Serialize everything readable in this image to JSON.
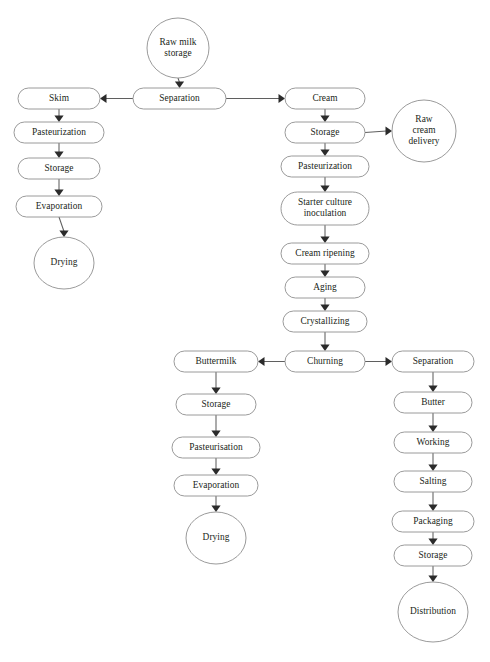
{
  "diagram": {
    "style": {
      "background": "#ffffff",
      "node_fill": "#ffffff",
      "node_stroke": "#8e8e8e",
      "edge_stroke": "#5f5f5f",
      "arrow_fill": "#2b2b2b",
      "label_color": "#221f20"
    },
    "nodes": [
      {
        "id": "raw_milk_storage",
        "label": "Raw milk\nstorage",
        "lines": [
          "Raw milk",
          "storage"
        ],
        "shape": "ellipse",
        "cx": 178,
        "cy": 48,
        "rx": 31,
        "ry": 30
      },
      {
        "id": "separation_top",
        "label": "Separation",
        "lines": [
          "Separation"
        ],
        "shape": "rounded-rect",
        "x": 133,
        "y": 88,
        "w": 93,
        "h": 21
      },
      {
        "id": "skim",
        "label": "Skim",
        "lines": [
          "Skim"
        ],
        "shape": "rounded-rect",
        "x": 18,
        "y": 88,
        "w": 82,
        "h": 21
      },
      {
        "id": "skim_pasteurization",
        "label": "Pasteurization",
        "lines": [
          "Pasteurization"
        ],
        "shape": "rounded-rect",
        "x": 14,
        "y": 122,
        "w": 90,
        "h": 21
      },
      {
        "id": "skim_storage",
        "label": "Storage",
        "lines": [
          "Storage"
        ],
        "shape": "rounded-rect",
        "x": 18,
        "y": 158,
        "w": 82,
        "h": 21
      },
      {
        "id": "skim_evaporation",
        "label": "Evaporation",
        "lines": [
          "Evaporation"
        ],
        "shape": "rounded-rect",
        "x": 16,
        "y": 196,
        "w": 86,
        "h": 21
      },
      {
        "id": "skim_drying",
        "label": "Drying",
        "lines": [
          "Drying"
        ],
        "shape": "ellipse",
        "cx": 64,
        "cy": 263,
        "rx": 30,
        "ry": 26
      },
      {
        "id": "cream",
        "label": "Cream",
        "lines": [
          "Cream"
        ],
        "shape": "rounded-rect",
        "x": 285,
        "y": 88,
        "w": 80,
        "h": 21
      },
      {
        "id": "cream_storage",
        "label": "Storage",
        "lines": [
          "Storage"
        ],
        "shape": "rounded-rect",
        "x": 285,
        "y": 122,
        "w": 80,
        "h": 21
      },
      {
        "id": "raw_cream_delivery",
        "label": "Raw cream delivery",
        "lines": [
          "Raw",
          "cream",
          "delivery"
        ],
        "shape": "ellipse",
        "cx": 424,
        "cy": 131,
        "rx": 32,
        "ry": 31
      },
      {
        "id": "cream_pasteurization",
        "label": "Pasteurization",
        "lines": [
          "Pasteurization"
        ],
        "shape": "rounded-rect",
        "x": 281,
        "y": 156,
        "w": 88,
        "h": 21
      },
      {
        "id": "starter_culture",
        "label": "Starter culture inoculation",
        "lines": [
          "Starter culture",
          "inoculation"
        ],
        "shape": "rounded-rect",
        "x": 281,
        "y": 192,
        "w": 88,
        "h": 33
      },
      {
        "id": "cream_ripening",
        "label": "Cream ripening",
        "lines": [
          "Cream ripening"
        ],
        "shape": "rounded-rect",
        "x": 281,
        "y": 243,
        "w": 88,
        "h": 21
      },
      {
        "id": "aging",
        "label": "Aging",
        "lines": [
          "Aging"
        ],
        "shape": "rounded-rect",
        "x": 285,
        "y": 277,
        "w": 80,
        "h": 21
      },
      {
        "id": "crystallizing",
        "label": "Crystallizing",
        "lines": [
          "Crystallizing"
        ],
        "shape": "rounded-rect",
        "x": 283,
        "y": 311,
        "w": 84,
        "h": 21
      },
      {
        "id": "churning",
        "label": "Churning",
        "lines": [
          "Churning"
        ],
        "shape": "rounded-rect",
        "x": 285,
        "y": 351,
        "w": 80,
        "h": 21
      },
      {
        "id": "buttermilk",
        "label": "Buttermilk",
        "lines": [
          "Buttermilk"
        ],
        "shape": "rounded-rect",
        "x": 174,
        "y": 351,
        "w": 84,
        "h": 21
      },
      {
        "id": "buttermilk_storage",
        "label": "Storage",
        "lines": [
          "Storage"
        ],
        "shape": "rounded-rect",
        "x": 176,
        "y": 394,
        "w": 80,
        "h": 21
      },
      {
        "id": "buttermilk_pasteurisation",
        "label": "Pasteurisation",
        "lines": [
          "Pasteurisation"
        ],
        "shape": "rounded-rect",
        "x": 172,
        "y": 437,
        "w": 88,
        "h": 21
      },
      {
        "id": "buttermilk_evaporation",
        "label": "Evaporation",
        "lines": [
          "Evaporation"
        ],
        "shape": "rounded-rect",
        "x": 174,
        "y": 475,
        "w": 84,
        "h": 21
      },
      {
        "id": "buttermilk_drying",
        "label": "Drying",
        "lines": [
          "Drying"
        ],
        "shape": "ellipse",
        "cx": 216,
        "cy": 538,
        "rx": 30,
        "ry": 26
      },
      {
        "id": "separation_bottom",
        "label": "Separation",
        "lines": [
          "Separation"
        ],
        "shape": "rounded-rect",
        "x": 392,
        "y": 351,
        "w": 82,
        "h": 21
      },
      {
        "id": "butter",
        "label": "Butter",
        "lines": [
          "Butter"
        ],
        "shape": "rounded-rect",
        "x": 394,
        "y": 392,
        "w": 78,
        "h": 21
      },
      {
        "id": "working",
        "label": "Working",
        "lines": [
          "Working"
        ],
        "shape": "rounded-rect",
        "x": 394,
        "y": 432,
        "w": 78,
        "h": 21
      },
      {
        "id": "salting",
        "label": "Salting",
        "lines": [
          "Salting"
        ],
        "shape": "rounded-rect",
        "x": 394,
        "y": 471,
        "w": 78,
        "h": 21
      },
      {
        "id": "packaging",
        "label": "Packaging",
        "lines": [
          "Packaging"
        ],
        "shape": "rounded-rect",
        "x": 392,
        "y": 511,
        "w": 82,
        "h": 21
      },
      {
        "id": "butter_storage",
        "label": "Storage",
        "lines": [
          "Storage"
        ],
        "shape": "rounded-rect",
        "x": 394,
        "y": 545,
        "w": 78,
        "h": 21
      },
      {
        "id": "distribution",
        "label": "Distribution",
        "lines": [
          "Distribution"
        ],
        "shape": "ellipse",
        "cx": 433,
        "cy": 612,
        "rx": 35,
        "ry": 30
      }
    ],
    "edges": [
      {
        "id": "e-rawmilk-separation",
        "from": "raw_milk_storage",
        "to": "separation_top",
        "dir": "down"
      },
      {
        "id": "e-separation-skim",
        "from": "separation_top",
        "to": "skim",
        "dir": "left"
      },
      {
        "id": "e-separation-cream",
        "from": "separation_top",
        "to": "cream",
        "dir": "right"
      },
      {
        "id": "e-skim-pasteurization",
        "from": "skim",
        "to": "skim_pasteurization",
        "dir": "down"
      },
      {
        "id": "e-pasteurization-storage",
        "from": "skim_pasteurization",
        "to": "skim_storage",
        "dir": "down"
      },
      {
        "id": "e-storage-evaporation",
        "from": "skim_storage",
        "to": "skim_evaporation",
        "dir": "down"
      },
      {
        "id": "e-evaporation-drying",
        "from": "skim_evaporation",
        "to": "skim_drying",
        "dir": "down"
      },
      {
        "id": "e-cream-storage",
        "from": "cream",
        "to": "cream_storage",
        "dir": "down"
      },
      {
        "id": "e-storage-rawcream",
        "from": "cream_storage",
        "to": "raw_cream_delivery",
        "dir": "right"
      },
      {
        "id": "e-storage-pasteurization",
        "from": "cream_storage",
        "to": "cream_pasteurization",
        "dir": "down"
      },
      {
        "id": "e-pasteurization-starter",
        "from": "cream_pasteurization",
        "to": "starter_culture",
        "dir": "down"
      },
      {
        "id": "e-starter-ripening",
        "from": "starter_culture",
        "to": "cream_ripening",
        "dir": "down"
      },
      {
        "id": "e-ripening-aging",
        "from": "cream_ripening",
        "to": "aging",
        "dir": "down"
      },
      {
        "id": "e-aging-crystallizing",
        "from": "aging",
        "to": "crystallizing",
        "dir": "down"
      },
      {
        "id": "e-crystallizing-churning",
        "from": "crystallizing",
        "to": "churning",
        "dir": "down"
      },
      {
        "id": "e-churning-buttermilk",
        "from": "churning",
        "to": "buttermilk",
        "dir": "left"
      },
      {
        "id": "e-churning-separation",
        "from": "churning",
        "to": "separation_bottom",
        "dir": "right"
      },
      {
        "id": "e-buttermilk-storage",
        "from": "buttermilk",
        "to": "buttermilk_storage",
        "dir": "down"
      },
      {
        "id": "e-bmstorage-pasteurisation",
        "from": "buttermilk_storage",
        "to": "buttermilk_pasteurisation",
        "dir": "down"
      },
      {
        "id": "e-pasteurisation-evaporation",
        "from": "buttermilk_pasteurisation",
        "to": "buttermilk_evaporation",
        "dir": "down"
      },
      {
        "id": "e-bmevaporation-drying",
        "from": "buttermilk_evaporation",
        "to": "buttermilk_drying",
        "dir": "down"
      },
      {
        "id": "e-separation-butter",
        "from": "separation_bottom",
        "to": "butter",
        "dir": "down"
      },
      {
        "id": "e-butter-working",
        "from": "butter",
        "to": "working",
        "dir": "down"
      },
      {
        "id": "e-working-salting",
        "from": "working",
        "to": "salting",
        "dir": "down"
      },
      {
        "id": "e-salting-packaging",
        "from": "salting",
        "to": "packaging",
        "dir": "down"
      },
      {
        "id": "e-packaging-storage",
        "from": "packaging",
        "to": "butter_storage",
        "dir": "down"
      },
      {
        "id": "e-storage-distribution",
        "from": "butter_storage",
        "to": "distribution",
        "dir": "down"
      }
    ]
  }
}
